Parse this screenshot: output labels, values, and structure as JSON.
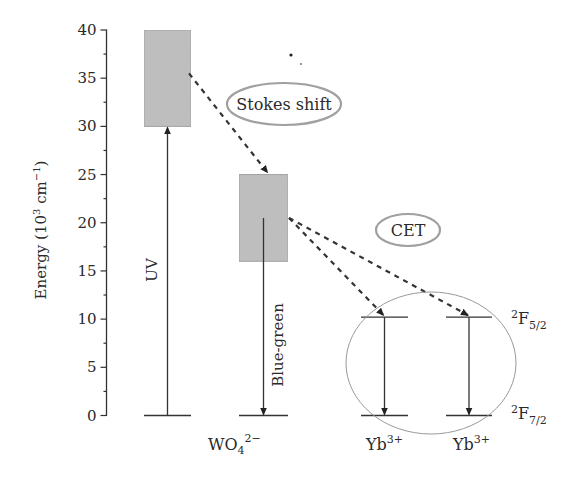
{
  "chart_data": {
    "type": "energy-level-diagram",
    "title": "",
    "ylabel": "Energy (10^3 cm^-1)",
    "ylabel_parts": {
      "base": "Energy (10",
      "sup1": "3",
      "mid": " cm",
      "sup2": "−1",
      "end": ")"
    },
    "ylim": [
      0,
      40
    ],
    "yticks": [
      0,
      5,
      10,
      15,
      20,
      25,
      30,
      35,
      40
    ],
    "minor_tick_step": 2.5,
    "colors": {
      "band_fill": "#bdbdbd",
      "band_stroke": "#9a9a9a",
      "line": "#333333",
      "ellipse": "#9a9a9a"
    },
    "species": [
      {
        "id": "wo4",
        "label_base": "WO",
        "label_sub": "4",
        "label_sup": "2−"
      },
      {
        "id": "yb1",
        "label_base": "Yb",
        "label_sup": "3+"
      },
      {
        "id": "yb2",
        "label_base": "Yb",
        "label_sup": "3+"
      }
    ],
    "bands": [
      {
        "name": "WO4 excited band (absorption)",
        "species": "wo4",
        "column": 0,
        "y_low": 30,
        "y_high": 40
      },
      {
        "name": "WO4 emitting band",
        "species": "wo4",
        "column": 1,
        "y_low": 16,
        "y_high": 25
      }
    ],
    "levels": [
      {
        "species": "wo4",
        "column": 0,
        "energy": 0
      },
      {
        "species": "wo4",
        "column": 1,
        "energy": 0
      },
      {
        "species": "yb1",
        "column": 2,
        "energy": 10.2,
        "term": "2F5/2"
      },
      {
        "species": "yb1",
        "column": 2,
        "energy": 0,
        "term": "2F7/2"
      },
      {
        "species": "yb2",
        "column": 3,
        "energy": 10.2
      },
      {
        "species": "yb2",
        "column": 3,
        "energy": 0
      }
    ],
    "transitions": [
      {
        "label": "UV",
        "type": "absorption",
        "from": 0,
        "to": 30,
        "column": 0,
        "style": "solid"
      },
      {
        "label": "Blue-green",
        "type": "emission",
        "from": 20.5,
        "to": 0,
        "column": 1,
        "style": "solid"
      },
      {
        "label": "",
        "type": "emission",
        "from": 10.2,
        "to": 0,
        "column": 2,
        "style": "solid"
      },
      {
        "label": "",
        "type": "emission",
        "from": 10.2,
        "to": 0,
        "column": 3,
        "style": "solid"
      },
      {
        "label": "Stokes shift",
        "type": "relaxation",
        "from_column": 0,
        "from": 35.5,
        "to_column": 1,
        "to": 25,
        "style": "dashed"
      },
      {
        "label": "CET",
        "type": "energy-transfer",
        "from_column": 1,
        "from": 20.5,
        "to_column": 2,
        "to": 10.2,
        "style": "dashed"
      },
      {
        "label": "CET",
        "type": "energy-transfer",
        "from_column": 1,
        "from": 20.5,
        "to_column": 3,
        "to": 10.2,
        "style": "dashed"
      }
    ],
    "annotations": {
      "stokes_shift": "Stokes shift",
      "cet": "CET",
      "uv": "UV",
      "blue_green": "Blue-green"
    },
    "terms": {
      "upper": {
        "sup": "2",
        "base": "F",
        "sub": "5/2"
      },
      "lower": {
        "sup": "2",
        "base": "F",
        "sub": "7/2"
      }
    }
  }
}
